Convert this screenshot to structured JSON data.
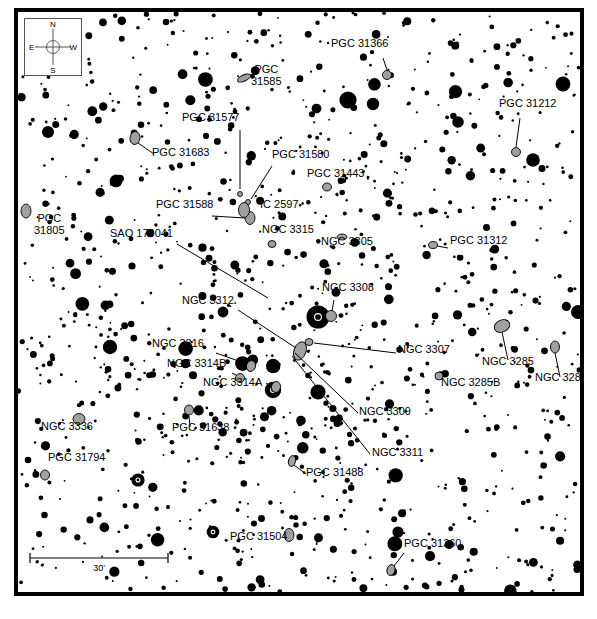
{
  "chart": {
    "type": "astronomical-finder-chart",
    "width": 597,
    "height": 619,
    "background_color": "#ffffff",
    "frame_color": "#000000",
    "star_color": "#000000",
    "galaxy_fill_color": "#a0a0a0",
    "galaxy_stroke_color": "#000000",
    "leader_line_color": "#000000"
  },
  "compass": {
    "name": "compass-rose",
    "north": "N",
    "south": "S",
    "east": "E",
    "west": "W"
  },
  "scale": {
    "label": "30'",
    "value": 30,
    "unit": "arcmin"
  },
  "objects": [
    {
      "id": "pgc31366",
      "label": "PGC 31366",
      "lx": 327,
      "ly": 44,
      "gx": 383,
      "gy": 71,
      "lead": [
        [
          379,
          54
        ],
        [
          383,
          66
        ]
      ],
      "gw": 9,
      "gh": 9,
      "ga": 0
    },
    {
      "id": "pgc31585",
      "label": "PGC\n31585",
      "lx": 247,
      "ly": 70,
      "gx": 240,
      "gy": 74,
      "lead": null,
      "gw": 14,
      "gh": 6,
      "ga": -25
    },
    {
      "id": "pgc31212",
      "label": "PGC 31212",
      "lx": 495,
      "ly": 104,
      "gx": 512,
      "gy": 148,
      "lead": [
        [
          516,
          114
        ],
        [
          512,
          143
        ]
      ],
      "gw": 9,
      "gh": 9,
      "ga": 0
    },
    {
      "id": "pgc31577",
      "label": "PGC 31577",
      "lx": 178,
      "ly": 118,
      "gx": 236,
      "gy": 190,
      "lead": [
        [
          236,
          126
        ],
        [
          236,
          185
        ]
      ],
      "gw": 5,
      "gh": 5,
      "ga": 0
    },
    {
      "id": "pgc31683",
      "label": "PGC 31683",
      "lx": 148,
      "ly": 153,
      "gx": 131,
      "gy": 134,
      "lead": [
        [
          150,
          150
        ],
        [
          134,
          139
        ]
      ],
      "gw": 10,
      "gh": 13,
      "ga": 10
    },
    {
      "id": "pgc31580",
      "label": "PGC 31580",
      "lx": 268,
      "ly": 155,
      "gx": 244,
      "gy": 198,
      "lead": [
        [
          268,
          162
        ],
        [
          247,
          195
        ]
      ],
      "gw": 5,
      "gh": 5,
      "ga": 0
    },
    {
      "id": "pgc31443",
      "label": "PGC 31443",
      "lx": 303,
      "ly": 174,
      "gx": 323,
      "gy": 183,
      "lead": null,
      "gw": 9,
      "gh": 8,
      "ga": 0
    },
    {
      "id": "pgc31588",
      "label": "PGC 31588",
      "lx": 152,
      "ly": 205,
      "gx": 246,
      "gy": 214,
      "lead": [
        [
          208,
          212
        ],
        [
          241,
          214
        ]
      ],
      "gw": 10,
      "gh": 13,
      "ga": 0
    },
    {
      "id": "ic2597",
      "label": "IC 2597",
      "lx": 256,
      "ly": 205,
      "gx": 240,
      "gy": 206,
      "lead": null,
      "gw": 11,
      "gh": 15,
      "ga": 0
    },
    {
      "id": "pgc31805",
      "label": "PGC\n31805",
      "lx": 30,
      "ly": 219,
      "gx": 22,
      "gy": 207,
      "lead": null,
      "gw": 10,
      "gh": 14,
      "ga": 0
    },
    {
      "id": "ngc3315",
      "label": "NGC 3315",
      "lx": 258,
      "ly": 230,
      "gx": 268,
      "gy": 240,
      "lead": null,
      "gw": 8,
      "gh": 7,
      "ga": 0
    },
    {
      "id": "sao179041",
      "label": "SAO 179041",
      "lx": 106,
      "ly": 234,
      "gx": 269,
      "gy": 296,
      "lead": [
        [
          173,
          240
        ],
        [
          264,
          294
        ]
      ],
      "gw": 0,
      "gh": 0,
      "ga": 0
    },
    {
      "id": "ngc3305",
      "label": "NGC 3305",
      "lx": 317,
      "ly": 242,
      "gx": 338,
      "gy": 233,
      "lead": null,
      "gw": 10,
      "gh": 6,
      "ga": 0
    },
    {
      "id": "pgc31312",
      "label": "PGC 31312",
      "lx": 446,
      "ly": 241,
      "gx": 429,
      "gy": 241,
      "lead": [
        [
          444,
          244
        ],
        [
          433,
          242
        ]
      ],
      "gw": 9,
      "gh": 7,
      "ga": 0
    },
    {
      "id": "ngc3308",
      "label": "NGC 3308",
      "lx": 318,
      "ly": 288,
      "gx": 327,
      "gy": 312,
      "lead": [
        [
          330,
          296
        ],
        [
          328,
          307
        ]
      ],
      "gw": 11,
      "gh": 11,
      "ga": 0
    },
    {
      "id": "ngc3312",
      "label": "NGC 3312",
      "lx": 178,
      "ly": 301,
      "gx": 296,
      "gy": 347,
      "lead": [
        [
          234,
          306
        ],
        [
          292,
          344
        ]
      ],
      "gw": 12,
      "gh": 19,
      "ga": 20
    },
    {
      "id": "ngc3307",
      "label": "NGC 3307",
      "lx": 394,
      "ly": 350,
      "gx": 305,
      "gy": 338,
      "lead": [
        [
          392,
          349
        ],
        [
          310,
          339
        ]
      ],
      "gw": 8,
      "gh": 7,
      "ga": 0
    },
    {
      "id": "ngc3316",
      "label": "NGC 3316",
      "lx": 148,
      "ly": 344,
      "gx": 247,
      "gy": 362,
      "lead": [
        [
          212,
          349
        ],
        [
          243,
          360
        ]
      ],
      "gw": 9,
      "gh": 11,
      "ga": 15
    },
    {
      "id": "ngc3285",
      "label": "NGC 3285",
      "lx": 478,
      "ly": 362,
      "gx": 498,
      "gy": 322,
      "lead": [
        [
          504,
          356
        ],
        [
          498,
          328
        ]
      ],
      "gw": 16,
      "gh": 12,
      "ga": -25
    },
    {
      "id": "ngc3285a",
      "label": "NGC 3285A",
      "lx": 531,
      "ly": 378,
      "gx": 551,
      "gy": 343,
      "lead": [
        [
          556,
          373
        ],
        [
          551,
          349
        ]
      ],
      "gw": 9,
      "gh": 12,
      "ga": 0
    },
    {
      "id": "ngc3314b",
      "label": "NGC 3314B",
      "lx": 163,
      "ly": 364,
      "gx": 236,
      "gy": 374,
      "lead": [
        [
          228,
          369
        ],
        [
          234,
          372
        ]
      ],
      "gw": 9,
      "gh": 9,
      "ga": 0
    },
    {
      "id": "ngc3314a",
      "label": "NGC 3314A",
      "lx": 199,
      "ly": 383,
      "gx": 272,
      "gy": 383,
      "lead": [
        [
          262,
          379
        ],
        [
          268,
          382
        ]
      ],
      "gw": 9,
      "gh": 11,
      "ga": 10
    },
    {
      "id": "ngc3285b",
      "label": "NGC 3285B",
      "lx": 437,
      "ly": 383,
      "gx": 435,
      "gy": 372,
      "lead": null,
      "gw": 8,
      "gh": 8,
      "ga": 0
    },
    {
      "id": "ngc3309",
      "label": "NGC 3309",
      "lx": 355,
      "ly": 412,
      "gx": 289,
      "gy": 345,
      "lead": [
        [
          354,
          409
        ],
        [
          291,
          349
        ]
      ],
      "gw": 0,
      "gh": 0,
      "ga": 0
    },
    {
      "id": "ngc3311",
      "label": "NGC 3311",
      "lx": 368,
      "ly": 453,
      "gx": 286,
      "gy": 348,
      "lead": [
        [
          366,
          450
        ],
        [
          288,
          352
        ]
      ],
      "gw": 0,
      "gh": 0,
      "ga": 0
    },
    {
      "id": "ngc3336",
      "label": "NGC 3336",
      "lx": 37,
      "ly": 427,
      "gx": 75,
      "gy": 415,
      "lead": null,
      "gw": 12,
      "gh": 11,
      "ga": 0
    },
    {
      "id": "pgc31638",
      "label": "PGC 31638",
      "lx": 168,
      "ly": 428,
      "gx": 185,
      "gy": 406,
      "lead": [
        [
          186,
          423
        ],
        [
          185,
          412
        ]
      ],
      "gw": 9,
      "gh": 10,
      "ga": 0
    },
    {
      "id": "pgc31794",
      "label": "PGC 31794",
      "lx": 44,
      "ly": 458,
      "gx": 41,
      "gy": 471,
      "lead": null,
      "gw": 9,
      "gh": 10,
      "ga": 0
    },
    {
      "id": "pgc31488",
      "label": "PGC 31488",
      "lx": 302,
      "ly": 473,
      "gx": 288,
      "gy": 457,
      "lead": [
        [
          302,
          470
        ],
        [
          290,
          461
        ]
      ],
      "gw": 7,
      "gh": 11,
      "ga": 15
    },
    {
      "id": "pgc31504",
      "label": "PGC 31504",
      "lx": 226,
      "ly": 537,
      "gx": 285,
      "gy": 531,
      "lead": null,
      "gw": 10,
      "gh": 13,
      "ga": 0
    },
    {
      "id": "pgc31360",
      "label": "PGC 31360",
      "lx": 400,
      "ly": 544,
      "gx": 387,
      "gy": 566,
      "lead": [
        [
          400,
          549
        ],
        [
          390,
          562
        ]
      ],
      "gw": 8,
      "gh": 11,
      "ga": 15
    }
  ],
  "notes": {
    "galaxy_count": 31,
    "marker_legend": "Grey ellipses mark catalogued galaxies; black filled circles are field stars sized by magnitude."
  }
}
